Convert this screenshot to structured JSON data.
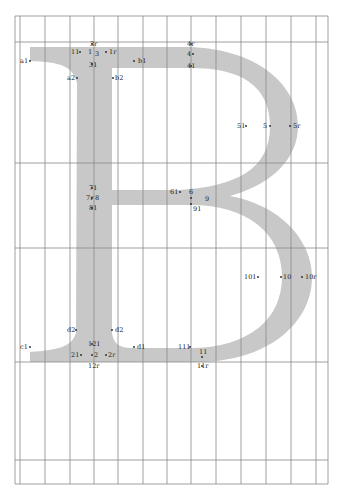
{
  "diagram": {
    "glyph": "B",
    "glyph_color": "#c8c8c8",
    "grid_color": "#888888",
    "background": "#ffffff",
    "grid": {
      "x_lines": [
        15,
        20,
        45,
        70,
        94,
        118,
        143,
        167,
        191,
        216,
        241,
        266,
        291,
        316,
        328
      ],
      "y_lines": [
        16,
        42,
        163,
        248,
        362,
        460,
        485
      ]
    },
    "labels": [
      {
        "text": "3r",
        "x": 90,
        "y": 46
      },
      {
        "text": "11",
        "x": 71,
        "y": 54
      },
      {
        "text": "1",
        "x": 88,
        "y": 54
      },
      {
        "text": "3",
        "x": 95,
        "y": 56
      },
      {
        "text": "1r",
        "x": 109,
        "y": 54
      },
      {
        "text": "31",
        "x": 89,
        "y": 67
      },
      {
        "text": "a1",
        "x": 20,
        "y": 63
      },
      {
        "text": "b1",
        "x": 138,
        "y": 63
      },
      {
        "text": "a2",
        "x": 67,
        "y": 80
      },
      {
        "text": "b2",
        "x": 115,
        "y": 80
      },
      {
        "text": "4r",
        "x": 187,
        "y": 46
      },
      {
        "text": "4",
        "x": 187,
        "y": 56
      },
      {
        "text": "41",
        "x": 187,
        "y": 68
      },
      {
        "text": "51",
        "x": 237,
        "y": 128
      },
      {
        "text": "5",
        "x": 263,
        "y": 128
      },
      {
        "text": "5r",
        "x": 293,
        "y": 128
      },
      {
        "text": "71",
        "x": 89,
        "y": 190
      },
      {
        "text": "7r",
        "x": 86,
        "y": 200
      },
      {
        "text": "8",
        "x": 95,
        "y": 200
      },
      {
        "text": "81",
        "x": 89,
        "y": 210
      },
      {
        "text": "61",
        "x": 170,
        "y": 194
      },
      {
        "text": "6",
        "x": 189,
        "y": 194
      },
      {
        "text": "9",
        "x": 205,
        "y": 201
      },
      {
        "text": "91",
        "x": 193,
        "y": 211
      },
      {
        "text": "101",
        "x": 244,
        "y": 279
      },
      {
        "text": "10",
        "x": 283,
        "y": 279
      },
      {
        "text": "10r",
        "x": 305,
        "y": 279
      },
      {
        "text": "d2",
        "x": 67,
        "y": 332
      },
      {
        "text": "d2",
        "x": 115,
        "y": 332
      },
      {
        "text": "121",
        "x": 88,
        "y": 346
      },
      {
        "text": "c1",
        "x": 20,
        "y": 349
      },
      {
        "text": "d1",
        "x": 137,
        "y": 349
      },
      {
        "text": "111",
        "x": 178,
        "y": 349
      },
      {
        "text": "11",
        "x": 199,
        "y": 354
      },
      {
        "text": "21",
        "x": 71,
        "y": 357
      },
      {
        "text": "2",
        "x": 94,
        "y": 357
      },
      {
        "text": "2r",
        "x": 108,
        "y": 357
      },
      {
        "text": "12r",
        "x": 88,
        "y": 368
      },
      {
        "text": "11r",
        "x": 197,
        "y": 368
      }
    ],
    "dots": [
      [
        30,
        61
      ],
      [
        80,
        52
      ],
      [
        106,
        52
      ],
      [
        134,
        61
      ],
      [
        77,
        78
      ],
      [
        113,
        78
      ],
      [
        92,
        44
      ],
      [
        92,
        64
      ],
      [
        191,
        44
      ],
      [
        193,
        54
      ],
      [
        191,
        66
      ],
      [
        246,
        126
      ],
      [
        270,
        126
      ],
      [
        290,
        126
      ],
      [
        92,
        188
      ],
      [
        92,
        198
      ],
      [
        92,
        208
      ],
      [
        180,
        192
      ],
      [
        191,
        198
      ],
      [
        191,
        204
      ],
      [
        258,
        277
      ],
      [
        281,
        277
      ],
      [
        302,
        277
      ],
      [
        76,
        330
      ],
      [
        112,
        330
      ],
      [
        30,
        347
      ],
      [
        134,
        347
      ],
      [
        190,
        347
      ],
      [
        92,
        344
      ],
      [
        81,
        355
      ],
      [
        92,
        355
      ],
      [
        106,
        355
      ],
      [
        202,
        357
      ],
      [
        202,
        366
      ]
    ]
  }
}
